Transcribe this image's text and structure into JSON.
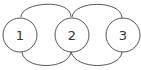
{
  "diagram": {
    "type": "graph",
    "stroke_color": "#555555",
    "label_color": "#333333",
    "background": "#ffffff",
    "nodes": [
      {
        "id": "1",
        "label": "1",
        "cx": 20,
        "cy": 35,
        "r": 17
      },
      {
        "id": "2",
        "label": "2",
        "cx": 72,
        "cy": 35,
        "r": 17
      },
      {
        "id": "3",
        "label": "3",
        "cx": 123,
        "cy": 35,
        "r": 17
      }
    ],
    "edges": [
      {
        "from": "1",
        "to": "2",
        "side": "top"
      },
      {
        "from": "1",
        "to": "2",
        "side": "bottom"
      },
      {
        "from": "2",
        "to": "3",
        "side": "top"
      },
      {
        "from": "2",
        "to": "3",
        "side": "bottom"
      }
    ]
  }
}
